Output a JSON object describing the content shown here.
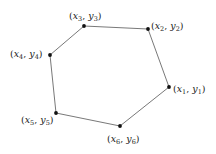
{
  "diagram": {
    "type": "polygon",
    "stroke_color": "#555555",
    "vertex_color": "#111111",
    "vertices": [
      {
        "id": 1,
        "x": 169,
        "y": 87,
        "var_x": "x",
        "var_y": "y",
        "sub": "1",
        "label_x": 173,
        "label_y": 92
      },
      {
        "id": 2,
        "x": 148,
        "y": 29,
        "var_x": "x",
        "var_y": "y",
        "sub": "2",
        "label_x": 151,
        "label_y": 29
      },
      {
        "id": 3,
        "x": 84,
        "y": 26,
        "var_x": "x",
        "var_y": "y",
        "sub": "3",
        "label_x": 69,
        "label_y": 19
      },
      {
        "id": 4,
        "x": 50,
        "y": 55,
        "var_x": "x",
        "var_y": "y",
        "sub": "4",
        "label_x": 10,
        "label_y": 57
      },
      {
        "id": 5,
        "x": 56,
        "y": 113,
        "var_x": "x",
        "var_y": "y",
        "sub": "5",
        "label_x": 21,
        "label_y": 123
      },
      {
        "id": 6,
        "x": 120,
        "y": 126,
        "var_x": "x",
        "var_y": "y",
        "sub": "6",
        "label_x": 107,
        "label_y": 142
      }
    ]
  }
}
